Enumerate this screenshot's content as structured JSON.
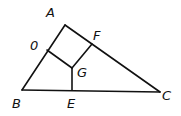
{
  "diagram": {
    "type": "geometry",
    "points": {
      "A": {
        "x": 65,
        "y": 25,
        "label": "A",
        "lx": 46,
        "ly": 17
      },
      "B": {
        "x": 22,
        "y": 90,
        "label": "B",
        "lx": 12,
        "ly": 108
      },
      "C": {
        "x": 160,
        "y": 92,
        "label": "C",
        "lx": 162,
        "ly": 100
      },
      "D": {
        "x": 47,
        "y": 50,
        "label": "0",
        "lx": 30,
        "ly": 50
      },
      "F": {
        "x": 92,
        "y": 44,
        "label": "F",
        "lx": 93,
        "ly": 40
      },
      "G": {
        "x": 72,
        "y": 68,
        "label": "G",
        "lx": 77,
        "ly": 77
      },
      "E": {
        "x": 72,
        "y": 90,
        "label": "E",
        "lx": 67,
        "ly": 108
      }
    },
    "segments": [
      [
        "A",
        "B"
      ],
      [
        "B",
        "C"
      ],
      [
        "A",
        "C"
      ],
      [
        "D",
        "G"
      ],
      [
        "F",
        "G"
      ],
      [
        "G",
        "E"
      ]
    ]
  }
}
